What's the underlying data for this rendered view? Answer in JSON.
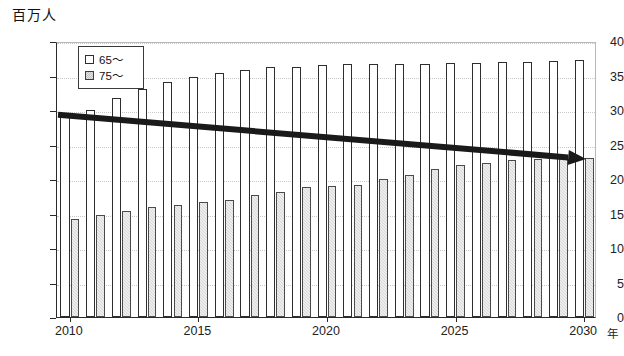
{
  "chart_data": {
    "type": "bar",
    "title": "",
    "ylabel": "百万人",
    "xlabel": "年",
    "ylim": [
      0,
      40
    ],
    "ytick_values": [
      0,
      5,
      10,
      15,
      20,
      25,
      30,
      35,
      40
    ],
    "ytick_labels": [
      "0",
      "5",
      "10",
      "15",
      "20",
      "25",
      "30",
      "35",
      "40"
    ],
    "grid": true,
    "legend_position": "top-left",
    "x": [
      2010,
      2011,
      2012,
      2013,
      2014,
      2015,
      2016,
      2017,
      2018,
      2019,
      2020,
      2021,
      2022,
      2023,
      2024,
      2025,
      2026,
      2027,
      2028,
      2029,
      2030
    ],
    "xtick_values": [
      2010,
      2015,
      2020,
      2025,
      2030
    ],
    "xtick_labels": [
      "2010",
      "2015",
      "2020",
      "2025",
      "2030"
    ],
    "series": [
      {
        "name": "65～",
        "color": "#ffffff",
        "values": [
          29.5,
          30.0,
          31.7,
          33.0,
          34.0,
          34.8,
          35.4,
          35.8,
          36.2,
          36.3,
          36.5,
          36.6,
          36.6,
          36.6,
          36.7,
          36.8,
          36.8,
          36.9,
          37.0,
          37.1,
          37.2
        ]
      },
      {
        "name": "75～",
        "color": "#d8d8d8",
        "values": [
          14.2,
          14.8,
          15.3,
          15.9,
          16.3,
          16.6,
          17.0,
          17.7,
          18.1,
          18.8,
          19.0,
          19.2,
          20.0,
          20.6,
          21.4,
          22.0,
          22.3,
          22.8,
          22.9,
          23.0,
          23.1
        ]
      }
    ],
    "annotations": [
      {
        "kind": "trend-arrow",
        "label": "",
        "from": {
          "x": 2010,
          "y": 29.6
        },
        "to": {
          "x": 2030,
          "y": 23.2
        },
        "color": "#1a1a1a",
        "arrowhead": "end"
      }
    ]
  },
  "legend": {
    "items": [
      {
        "label": "65～",
        "swatch": "open-square-icon"
      },
      {
        "label": "75～",
        "swatch": "hatched-square-icon"
      }
    ]
  },
  "axes": {
    "y_unit_label": "百万人",
    "x_unit_label": "年"
  }
}
